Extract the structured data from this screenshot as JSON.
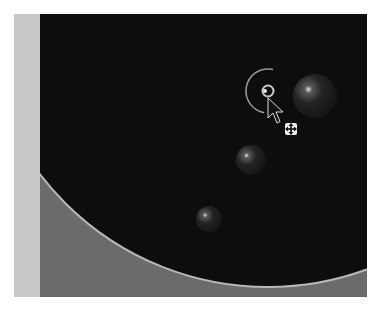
{
  "viewport": {
    "description": "3D viewport showing a large dark sphere edge with an arc guide, small spheres and a transform handle",
    "colors": {
      "background": "#6b6b6b",
      "side_strip": "#c9c9c9",
      "dark_region": "#0d0d0d",
      "arc_line": "#b8b8b8",
      "sphere": "#1c1c1c",
      "highlight": "#e0e0e0"
    }
  },
  "objects": {
    "large_sphere_arc": {
      "cx": 268,
      "cy": -14,
      "r": 301
    },
    "spheres": [
      {
        "name": "sphere-right",
        "cx": 301,
        "cy": 82,
        "r": 22
      },
      {
        "name": "sphere-middle",
        "cx": 237,
        "cy": 146,
        "r": 15
      },
      {
        "name": "sphere-lower",
        "cx": 195,
        "cy": 205,
        "r": 13
      }
    ],
    "handle": {
      "cx": 254,
      "cy": 77,
      "r_inner": 6,
      "r_outer": 22
    }
  },
  "cursor": {
    "type": "move-arrow",
    "tip_x": 254,
    "tip_y": 84
  }
}
